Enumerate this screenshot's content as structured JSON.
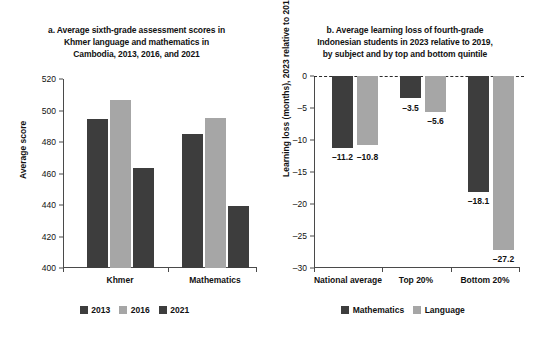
{
  "colors": {
    "dark": "#3d3d3d",
    "light": "#a6a6a6",
    "axis": "#4a4a4a",
    "text": "#111111",
    "background": "#ffffff"
  },
  "panel_a": {
    "title_lines": [
      "a. Average sixth-grade assessment scores in",
      "Khmer language and mathematics in",
      "Cambodia, 2013, 2016, and 2021"
    ],
    "ylabel": "Average score",
    "yticks": [
      "400",
      "420",
      "440",
      "460",
      "480",
      "500",
      "520"
    ],
    "categories": [
      "Khmer",
      "Mathematics"
    ],
    "legend": [
      {
        "label": "2013",
        "color": "#3d3d3d"
      },
      {
        "label": "2016",
        "color": "#a6a6a6"
      },
      {
        "label": "2021",
        "color": "#3d3d3d"
      }
    ]
  },
  "panel_b": {
    "title_lines": [
      "b. Average learning loss of fourth-grade",
      "Indonesian students in 2023 relative to 2019,",
      "by subject and by top and bottom quintile"
    ],
    "ylabel": "Learning loss (months), 2023 relative to 2019",
    "yticks": [
      "0",
      "–5",
      "–10",
      "–15",
      "–20",
      "–25",
      "–30"
    ],
    "categories": [
      "National average",
      "Top 20%",
      "Bottom 20%"
    ],
    "legend": [
      {
        "label": "Mathematics",
        "color": "#3d3d3d"
      },
      {
        "label": "Language",
        "color": "#a6a6a6"
      }
    ]
  },
  "chart_data": [
    {
      "type": "bar",
      "panel": "a",
      "title": "a. Average sixth-grade assessment scores in Khmer language and mathematics in Cambodia, 2013, 2016, and 2021",
      "xlabel": "",
      "ylabel": "Average score",
      "ylim": [
        400,
        520
      ],
      "ytick_values": [
        400,
        420,
        440,
        460,
        480,
        500,
        520
      ],
      "grid": false,
      "legend_position": "bottom",
      "categories": [
        "Khmer",
        "Mathematics"
      ],
      "series": [
        {
          "name": "2013",
          "color": "#3d3d3d",
          "values": [
            494.5,
            485.0
          ]
        },
        {
          "name": "2016",
          "color": "#a6a6a6",
          "values": [
            506.5,
            495.5
          ]
        },
        {
          "name": "2021",
          "color": "#3d3d3d",
          "values": [
            463.5,
            439.5
          ]
        }
      ]
    },
    {
      "type": "bar",
      "panel": "b",
      "title": "b. Average learning loss of fourth-grade Indonesian students in 2023 relative to 2019, by subject and by top and bottom quintile",
      "xlabel": "",
      "ylabel": "Learning loss (months), 2023 relative to 2019",
      "ylim": [
        -30,
        0
      ],
      "ytick_values": [
        0,
        -5,
        -10,
        -15,
        -20,
        -25,
        -30
      ],
      "grid": false,
      "zero_line": "dashed",
      "legend_position": "bottom",
      "categories": [
        "National average",
        "Top 20%",
        "Bottom 20%"
      ],
      "series": [
        {
          "name": "Mathematics",
          "color": "#3d3d3d",
          "values": [
            -11.2,
            -3.5,
            -18.1
          ],
          "labels": [
            "–11.2",
            "–3.5",
            "–18.1"
          ]
        },
        {
          "name": "Language",
          "color": "#a6a6a6",
          "values": [
            -10.8,
            -5.6,
            -27.2
          ],
          "labels": [
            "–10.8",
            "–5.6",
            "–27.2"
          ]
        }
      ]
    }
  ]
}
